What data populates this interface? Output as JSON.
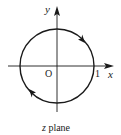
{
  "diagram": {
    "type": "contour-in-complex-plane",
    "caption_var": "z",
    "caption_rest": " plane",
    "axes": {
      "x_label": "x",
      "y_label": "y",
      "origin_label": "O",
      "unit_tick_label": "1"
    },
    "contour": {
      "shape": "unit circle",
      "center": [
        0,
        0
      ],
      "radius": 1,
      "direction": "clockwise",
      "arrow_count": 2
    },
    "colors": {
      "stroke": "#1a1a1a",
      "background": "#ffffff"
    }
  }
}
